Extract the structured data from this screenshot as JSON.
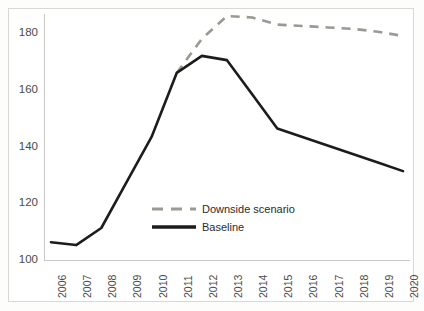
{
  "chart_data": {
    "type": "line",
    "title": "",
    "subtitle": "",
    "xlabel": "",
    "ylabel": "",
    "x": [
      2006,
      2007,
      2008,
      2009,
      2010,
      2011,
      2012,
      2013,
      2014,
      2015,
      2016,
      2017,
      2018,
      2019,
      2020
    ],
    "categories": [
      "2006",
      "2007",
      "2008",
      "2009",
      "2010",
      "2011",
      "2012",
      "2013",
      "2014",
      "2015",
      "2016",
      "2017",
      "2018",
      "2019",
      "2020"
    ],
    "xlim": [
      2006,
      2020
    ],
    "ylim": [
      100,
      188
    ],
    "yticks": [
      100,
      120,
      140,
      160,
      180
    ],
    "ytick_labels": [
      "100",
      "120",
      "140",
      "160",
      "180"
    ],
    "grid": false,
    "legend_position": "inside-center",
    "series": [
      {
        "name": "Downside scenario",
        "style": "dashed",
        "color": "#9a9a93",
        "x": [
          2011,
          2012,
          2013,
          2014,
          2015,
          2016,
          2017,
          2018,
          2019,
          2020
        ],
        "values": [
          165.5,
          177.5,
          185.5,
          185.0,
          182.5,
          182.0,
          181.5,
          181.0,
          180.0,
          178.5
        ]
      },
      {
        "name": "Baseline",
        "style": "solid",
        "color": "#1c1c1a",
        "x": [
          2006,
          2007,
          2008,
          2009,
          2010,
          2011,
          2012,
          2013,
          2014,
          2015,
          2016,
          2017,
          2018,
          2019,
          2020
        ],
        "values": [
          106.0,
          105.0,
          111.0,
          127.0,
          143.0,
          165.5,
          171.5,
          170.0,
          158.0,
          146.0,
          143.0,
          140.0,
          137.0,
          134.0,
          131.0
        ]
      }
    ],
    "legend": [
      {
        "label": "Downside scenario",
        "style": "dashed",
        "color": "#9a9a93"
      },
      {
        "label": "Baseline",
        "style": "solid",
        "color": "#1c1c1a"
      }
    ]
  },
  "colors": {
    "baseline": "#1c1c1a",
    "downside": "#9a9a93",
    "axis": "#c9c9c6",
    "tick_text": "#4a4a48",
    "frame": "#d8d8d4",
    "background": "#ffffff"
  }
}
